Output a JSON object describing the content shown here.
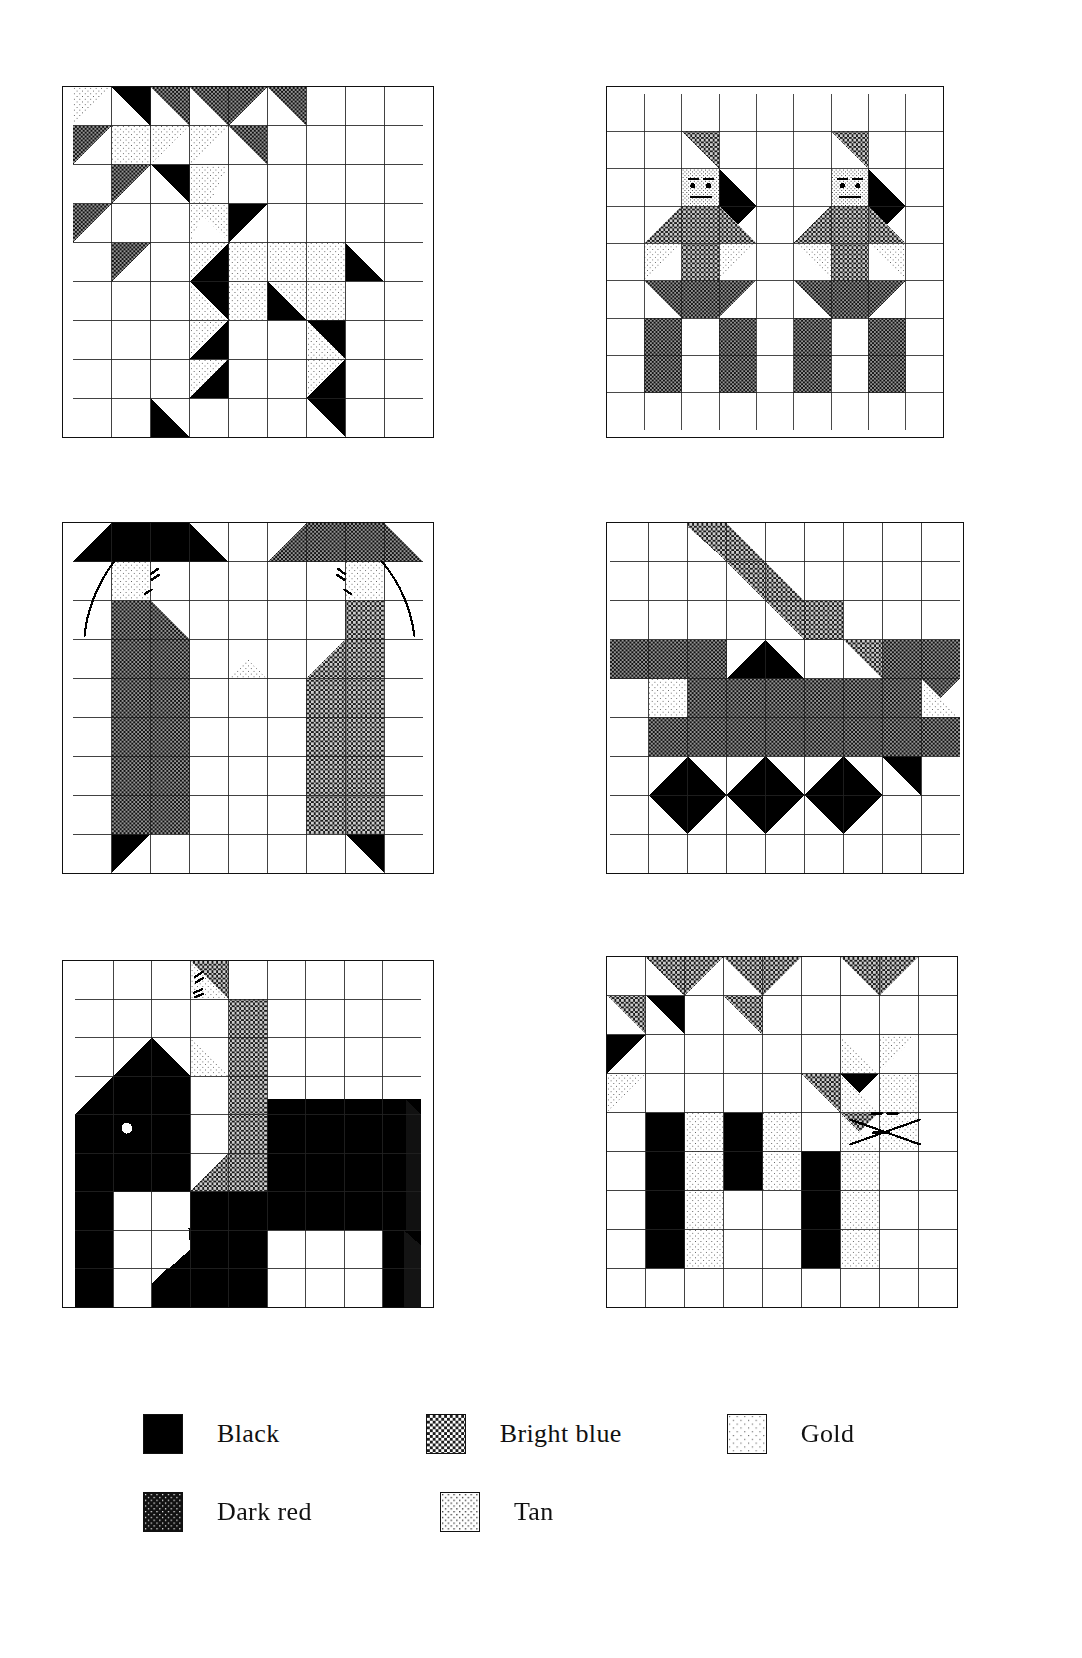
{
  "palette": {
    "black": "#000000",
    "dark_red": "#3a3a3a",
    "bright_blue": "#565656",
    "tan": "#c9c9c9",
    "gold": "#e2e2e2",
    "white": "#ffffff",
    "line": "#111111"
  },
  "grid": {
    "cols": 9,
    "rows": 9
  },
  "legend": {
    "title": "Fabric key",
    "rows": [
      [
        {
          "label": "Black",
          "swatch": "black",
          "swatch_name": "swatch-black"
        },
        {
          "label": "Bright blue",
          "swatch": "bright_blue",
          "swatch_name": "swatch-bright-blue"
        },
        {
          "label": "Gold",
          "swatch": "gold",
          "swatch_name": "swatch-gold"
        }
      ],
      [
        {
          "label": "Dark red",
          "swatch": "dark_red",
          "swatch_name": "swatch-dark-red"
        },
        {
          "label": "Tan",
          "swatch": "tan",
          "swatch_name": "swatch-tan"
        }
      ]
    ]
  },
  "blocks": [
    {
      "id": "block-1",
      "name": "pieced-diagonal-block",
      "position": {
        "x": 62,
        "y": 86,
        "w": 372,
        "h": 352
      }
    },
    {
      "id": "block-2",
      "name": "two-figures-block",
      "position": {
        "x": 606,
        "y": 86,
        "w": 338,
        "h": 352
      }
    },
    {
      "id": "block-3",
      "name": "two-hatted-figures-block",
      "position": {
        "x": 62,
        "y": 522,
        "w": 372,
        "h": 352
      }
    },
    {
      "id": "block-4",
      "name": "animal-with-diamonds-block",
      "position": {
        "x": 606,
        "y": 522,
        "w": 358,
        "h": 352
      }
    },
    {
      "id": "block-5",
      "name": "elephant-block",
      "position": {
        "x": 62,
        "y": 960,
        "w": 372,
        "h": 348
      }
    },
    {
      "id": "block-6",
      "name": "cat-block",
      "position": {
        "x": 606,
        "y": 956,
        "w": 352,
        "h": 352
      }
    }
  ]
}
